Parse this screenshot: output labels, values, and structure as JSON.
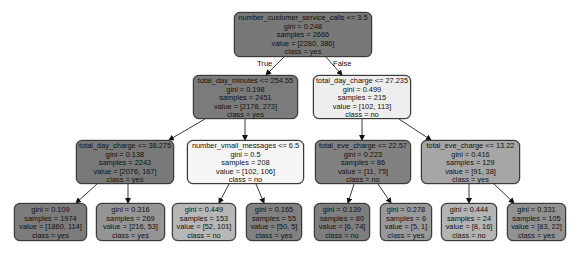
{
  "edge_labels": {
    "true_label": "True",
    "false_label": "False"
  },
  "nodes": {
    "n0": {
      "split": "number_customer_service_calls <= 3.5",
      "gini": "gini = 0.248",
      "samples": "samples = 2666",
      "value": "value = [2280, 386]",
      "class": "class = yes",
      "fill": "#787878"
    },
    "n1": {
      "split": "total_day_minutes <= 254.55",
      "gini": "gini = 0.198",
      "samples": "samples = 2451",
      "value": "value = [2178, 273]",
      "class": "class = yes",
      "fill": "#7b7b7b"
    },
    "n2": {
      "split": "total_day_charge <= 27.235",
      "gini": "gini = 0.499",
      "samples": "samples = 215",
      "value": "value = [102, 113]",
      "class": "class = no",
      "fill": "#ededed"
    },
    "n3": {
      "split": "total_day_charge <= 38.275",
      "gini": "gini = 0.138",
      "samples": "samples = 2243",
      "value": "value = [2076, 167]",
      "class": "class = yes",
      "fill": "#797979"
    },
    "n4": {
      "split": "number_vmail_messages <= 6.5",
      "gini": "gini = 0.5",
      "samples": "samples = 208",
      "value": "value = [102, 106]",
      "class": "class = no",
      "fill": "#f5f5f5"
    },
    "n5": {
      "split": "total_eve_charge <= 22.57",
      "gini": "gini = 0.223",
      "samples": "samples = 86",
      "value": "value = [11, 75]",
      "class": "class = no",
      "fill": "#818181"
    },
    "n6": {
      "split": "total_eve_charge <= 13.22",
      "gini": "gini = 0.416",
      "samples": "samples = 129",
      "value": "value = [91, 38]",
      "class": "class = yes",
      "fill": "#a6a6a6"
    },
    "l0": {
      "gini": "gini = 0.109",
      "samples": "samples = 1974",
      "value": "value = [1860, 114]",
      "class": "class = yes",
      "fill": "#7c7c7c"
    },
    "l1": {
      "gini": "gini = 0.316",
      "samples": "samples = 269",
      "value": "value = [216, 53]",
      "class": "class = yes",
      "fill": "#959595"
    },
    "l2": {
      "gini": "gini = 0.449",
      "samples": "samples = 153",
      "value": "value = [52, 101]",
      "class": "class = no",
      "fill": "#b7b7b7"
    },
    "l3": {
      "gini": "gini = 0.165",
      "samples": "samples = 55",
      "value": "value = [50, 5]",
      "class": "class = yes",
      "fill": "#818181"
    },
    "l4": {
      "gini": "gini = 0.139",
      "samples": "samples = 80",
      "value": "value = [6, 74]",
      "class": "class = no",
      "fill": "#7e7e7e"
    },
    "l5": {
      "gini": "gini = 0.278",
      "samples": "samples = 6",
      "value": "value = [5, 1]",
      "class": "class = yes",
      "fill": "#999999"
    },
    "l6": {
      "gini": "gini = 0.444",
      "samples": "samples = 24",
      "value": "value = [8, 16]",
      "class": "class = no",
      "fill": "#b4b4b4"
    },
    "l7": {
      "gini": "gini = 0.331",
      "samples": "samples = 105",
      "value": "value = [83, 22]",
      "class": "class = yes",
      "fill": "#929292"
    }
  }
}
